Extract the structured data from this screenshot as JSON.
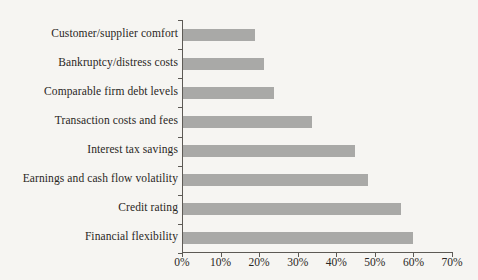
{
  "chart_data": {
    "type": "bar",
    "orientation": "horizontal",
    "title": "",
    "subtitle": "",
    "xlabel": "",
    "ylabel": "",
    "categories": [
      "Customer/supplier comfort",
      "Bankruptcy/distress costs",
      "Comparable firm debt levels",
      "Transaction costs and fees",
      "Interest tax savings",
      "Earnings and cash flow volatility",
      "Credit rating",
      "Financial flexibility"
    ],
    "values": [
      18.7,
      21.0,
      23.5,
      33.5,
      44.5,
      48.0,
      56.5,
      59.5
    ],
    "value_unit": "%",
    "xlim": [
      0,
      70
    ],
    "xticks": [
      0,
      10,
      20,
      30,
      40,
      50,
      60,
      70
    ],
    "xtick_labels": [
      "0%",
      "10%",
      "20%",
      "30%",
      "40%",
      "50%",
      "60%",
      "70%"
    ],
    "grid": false,
    "legend": null,
    "bar_color": "#a9a9a7",
    "axis_color": "#5d5a55",
    "background_color": "#f6f5f2"
  }
}
